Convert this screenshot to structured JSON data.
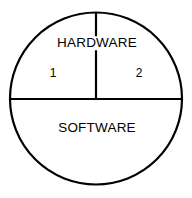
{
  "diagram": {
    "background_color": "#ffffff",
    "stroke_color": "#000000",
    "text_color": "#000000",
    "circle": {
      "center_x": 96,
      "center_y": 98.5,
      "radius": 86,
      "stroke_width": 2.2
    },
    "dividers": {
      "horizontal": {
        "name": "horizontal-divider",
        "x1": 10,
        "y1": 99,
        "x2": 182,
        "y2": 99,
        "stroke_width": 2.2
      },
      "vertical": {
        "name": "vertical-divider",
        "x1": 96,
        "y1": 12.5,
        "x2": 96,
        "y2": 99,
        "stroke_width": 2.2
      }
    },
    "labels": {
      "hardware": {
        "text": "HARDWARE",
        "x": 97,
        "y": 43
      },
      "software": {
        "text": "SOFTWARE",
        "x": 97,
        "y": 128
      },
      "segment_one": {
        "text": "1",
        "x": 53,
        "y": 73
      },
      "segment_two": {
        "text": "2",
        "x": 139,
        "y": 73
      }
    }
  }
}
